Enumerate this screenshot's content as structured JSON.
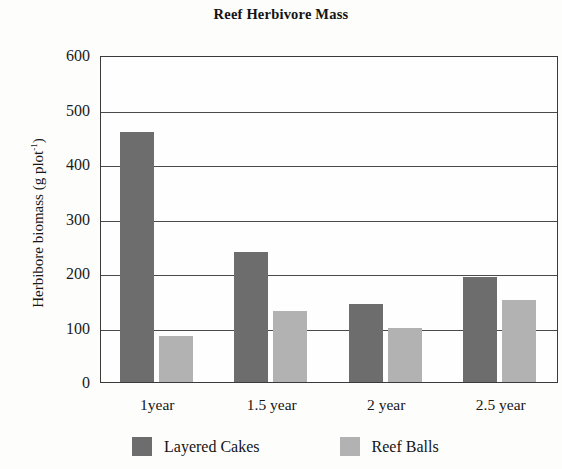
{
  "chart_data": {
    "type": "bar",
    "title": "Reef Herbivore Mass",
    "xlabel": "",
    "ylabel": "Herbibore biomass (g plot-1)",
    "ylabel_base": "Herbibore biomass (g plot",
    "ylabel_sup": "-1",
    "ylabel_close": ")",
    "categories": [
      "1year",
      "1.5 year",
      "2 year",
      "2.5 year"
    ],
    "series": [
      {
        "name": "Layered Cakes",
        "color": "#6d6d6d",
        "values": [
          459,
          239,
          143,
          193
        ]
      },
      {
        "name": "Reef Balls",
        "color": "#b2b2b2",
        "values": [
          85,
          130,
          99,
          151
        ]
      }
    ],
    "ylim": [
      0,
      600
    ],
    "y_ticks": [
      "0",
      "100",
      "200",
      "300",
      "400",
      "500",
      "600"
    ],
    "y_tick_values": [
      0,
      100,
      200,
      300,
      400,
      500,
      600
    ],
    "grid": true,
    "legend_position": "bottom"
  }
}
